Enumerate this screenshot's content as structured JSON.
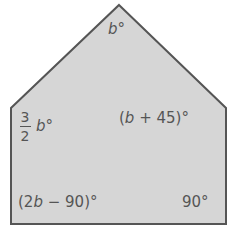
{
  "figure": {
    "type": "pentagon",
    "fill_color": "#d6d6d6",
    "stroke_color": "#555555",
    "vertices": [
      {
        "name": "top",
        "x": 119,
        "y": 5
      },
      {
        "name": "upper-right",
        "x": 226,
        "y": 108
      },
      {
        "name": "lower-right",
        "x": 226,
        "y": 224
      },
      {
        "name": "lower-left",
        "x": 11,
        "y": 224
      },
      {
        "name": "upper-left",
        "x": 11,
        "y": 108
      }
    ],
    "angles": {
      "top": {
        "var": "b",
        "suffix": "°"
      },
      "upper_left": {
        "numerator": "3",
        "denominator": "2",
        "var": "b",
        "suffix": "°"
      },
      "upper_right": {
        "open": "(",
        "var": "b",
        "rest": " + 45)",
        "suffix": "°"
      },
      "lower_left": {
        "open": "(2",
        "var": "b",
        "rest": " − 90)",
        "suffix": "°"
      },
      "lower_right": {
        "text": "90°"
      }
    }
  }
}
